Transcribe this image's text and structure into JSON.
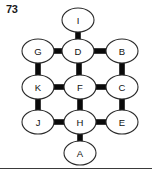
{
  "figure": {
    "label": "73",
    "width": 152,
    "height": 172,
    "background_color": "#ffffff",
    "node_fill_color": "#ffffff",
    "node_stroke_color": "#2a2a2a",
    "edge_color": "#0a0a0a",
    "label_text_color": "#111111"
  },
  "graph": {
    "type": "undirected-node-link-diagram",
    "layout": "hexagonal-grid-diamond",
    "node_shape": "ellipse",
    "node_rx": 16,
    "node_ry": 12,
    "rows": [
      {
        "row": 1,
        "nodes": [
          "I"
        ]
      },
      {
        "row": 2,
        "nodes": [
          "G",
          "D",
          "B"
        ]
      },
      {
        "row": 3,
        "nodes": [
          "K",
          "F",
          "C"
        ]
      },
      {
        "row": 4,
        "nodes": [
          "J",
          "H",
          "E"
        ]
      },
      {
        "row": 5,
        "nodes": [
          "A"
        ]
      }
    ],
    "nodes": [
      {
        "id": "I",
        "label": "I",
        "cx": 78,
        "cy": 20
      },
      {
        "id": "G",
        "label": "G",
        "cx": 38,
        "cy": 51
      },
      {
        "id": "D",
        "label": "D",
        "cx": 78,
        "cy": 51
      },
      {
        "id": "B",
        "label": "B",
        "cx": 122,
        "cy": 51
      },
      {
        "id": "K",
        "label": "K",
        "cx": 38,
        "cy": 87
      },
      {
        "id": "F",
        "label": "F",
        "cx": 80,
        "cy": 87
      },
      {
        "id": "C",
        "label": "C",
        "cx": 122,
        "cy": 87
      },
      {
        "id": "J",
        "label": "J",
        "cx": 38,
        "cy": 122
      },
      {
        "id": "H",
        "label": "H",
        "cx": 80,
        "cy": 122
      },
      {
        "id": "E",
        "label": "E",
        "cx": 122,
        "cy": 122
      },
      {
        "id": "A",
        "label": "A",
        "cx": 80,
        "cy": 153
      }
    ],
    "edges": [
      {
        "source": "I",
        "target": "D",
        "orientation": "vertical"
      },
      {
        "source": "G",
        "target": "D",
        "orientation": "horizontal"
      },
      {
        "source": "D",
        "target": "B",
        "orientation": "horizontal"
      },
      {
        "source": "G",
        "target": "K",
        "orientation": "vertical"
      },
      {
        "source": "D",
        "target": "F",
        "orientation": "vertical"
      },
      {
        "source": "B",
        "target": "C",
        "orientation": "vertical"
      },
      {
        "source": "K",
        "target": "F",
        "orientation": "horizontal"
      },
      {
        "source": "F",
        "target": "C",
        "orientation": "horizontal"
      },
      {
        "source": "K",
        "target": "J",
        "orientation": "vertical"
      },
      {
        "source": "F",
        "target": "H",
        "orientation": "vertical"
      },
      {
        "source": "C",
        "target": "E",
        "orientation": "vertical"
      },
      {
        "source": "J",
        "target": "H",
        "orientation": "horizontal"
      },
      {
        "source": "H",
        "target": "E",
        "orientation": "horizontal"
      },
      {
        "source": "H",
        "target": "A",
        "orientation": "vertical"
      }
    ],
    "edge_thickness": 5,
    "node_count": 11,
    "edge_count": 14
  }
}
